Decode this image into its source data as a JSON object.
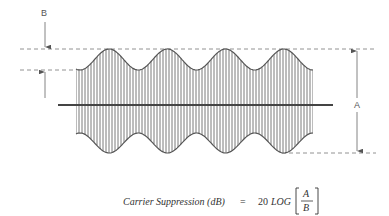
{
  "figure": {
    "labels": {
      "B": "B",
      "A": "A"
    },
    "colors": {
      "line": "#555555",
      "hatch": "#6a6a6a",
      "dash": "#777777",
      "background": "#ffffff"
    },
    "waveform": {
      "type": "AM suppressed carrier envelope",
      "cycles": 4,
      "x_start": 80,
      "x_end": 313,
      "top_peak_y": 49,
      "top_trough_y": 70,
      "bottom_peak_y": 153,
      "bottom_trough_y": 133,
      "center_line_y": 105
    }
  },
  "formula": {
    "lhs": "Carrier Suppression (dB)",
    "equals": "=",
    "coefficient": "20",
    "function": "LOG",
    "numerator": "A",
    "denominator": "B"
  }
}
